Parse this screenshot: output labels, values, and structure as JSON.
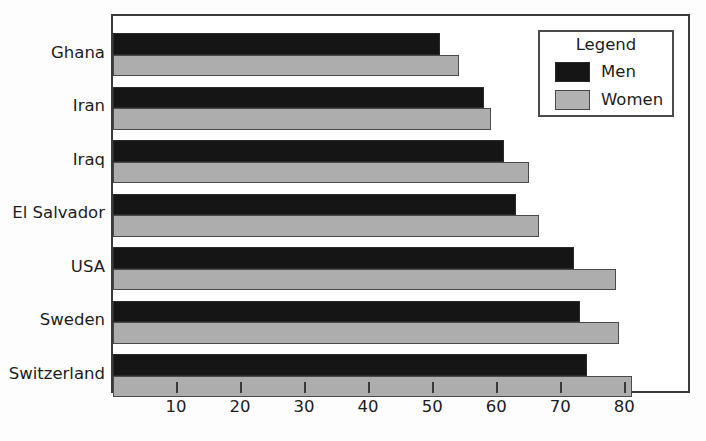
{
  "chart_data": {
    "type": "bar",
    "orientation": "horizontal",
    "title": "",
    "xlabel": "",
    "ylabel": "",
    "categories": [
      "Ghana",
      "Iran",
      "Iraq",
      "El Salvador",
      "USA",
      "Sweden",
      "Switzerland"
    ],
    "series": [
      {
        "name": "Men",
        "color": "#151515",
        "values": [
          51,
          58,
          61,
          63,
          72,
          73,
          74
        ]
      },
      {
        "name": "Women",
        "color": "#adadad",
        "values": [
          54,
          59,
          65,
          66.5,
          78.5,
          79,
          81
        ]
      }
    ],
    "xlim": [
      0,
      89.8
    ],
    "xticks": [
      10,
      20,
      30,
      40,
      50,
      60,
      70,
      80
    ],
    "xtick_labels": [
      "10",
      "20",
      "30",
      "40",
      "50",
      "60",
      "70",
      "80"
    ],
    "grid": false,
    "legend": {
      "title": "Legend",
      "position": "top-right",
      "entries": [
        {
          "label": "Men",
          "swatch": "men-swatch"
        },
        {
          "label": "Women",
          "swatch": "women-swatch"
        }
      ]
    }
  }
}
